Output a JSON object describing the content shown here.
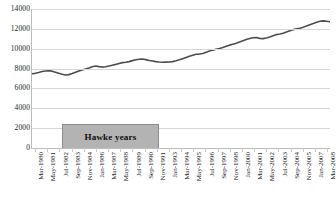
{
  "chart_data": {
    "type": "line",
    "title": "",
    "xlabel": "",
    "ylabel": "",
    "ylim": [
      0,
      14000
    ],
    "yticks": [
      0,
      2000,
      4000,
      6000,
      8000,
      10000,
      12000,
      14000
    ],
    "ytick_labels": [
      "0",
      "2000",
      "4000",
      "6000",
      "8000",
      "10000",
      "12000",
      "14000"
    ],
    "grid": true,
    "legend": "none",
    "series_color": "#4d4d4d",
    "grid_color": "#d6d6d6",
    "axis_color": "#bdbdbd",
    "annotations": [
      {
        "name": "hawke-years-box",
        "label": "Hawke years",
        "fill_color": "#b3b3b3",
        "border_color": "#8c8c8c",
        "x_start": "Sep-1983",
        "x_end": "Nov-1991",
        "y_top": 2000,
        "y_bottom": 0
      }
    ],
    "xtick_labels": [
      "Mar-1980",
      "May-1981",
      "Jul-1982",
      "Sep-1983",
      "Nov-1984",
      "Jan-1986",
      "Mar-1987",
      "May-1988",
      "Jul-1989",
      "Sep-1990",
      "Nov-1991",
      "Jan-1993",
      "Mar-1994",
      "May-1995",
      "Jul-1996",
      "Sep-1997",
      "Nov-1998",
      "Jan-2000",
      "Mar-2001",
      "May-2002",
      "Jul-2003",
      "Sep-2004",
      "Nov-2005",
      "Jan-2007",
      "Mar-2008"
    ],
    "values": [
      7480,
      7520,
      7600,
      7700,
      7760,
      7780,
      7740,
      7640,
      7520,
      7420,
      7360,
      7390,
      7500,
      7640,
      7760,
      7860,
      7960,
      8060,
      8180,
      8260,
      8200,
      8150,
      8180,
      8260,
      8340,
      8420,
      8520,
      8600,
      8640,
      8700,
      8800,
      8880,
      8940,
      8960,
      8900,
      8820,
      8760,
      8700,
      8660,
      8640,
      8650,
      8660,
      8700,
      8780,
      8880,
      9000,
      9120,
      9240,
      9340,
      9440,
      9460,
      9520,
      9640,
      9760,
      9860,
      9940,
      10020,
      10120,
      10240,
      10360,
      10460,
      10560,
      10680,
      10800,
      10920,
      11020,
      11100,
      11120,
      11040,
      11020,
      11080,
      11180,
      11300,
      11420,
      11480,
      11560,
      11680,
      11800,
      11920,
      12000,
      12060,
      12160,
      12300,
      12420,
      12540,
      12660,
      12760,
      12800,
      12760,
      12720
    ],
    "value_x_fraction_note": "values evenly spaced from Mar-1980 (0.0) to Mar-2008 (1.0)"
  }
}
